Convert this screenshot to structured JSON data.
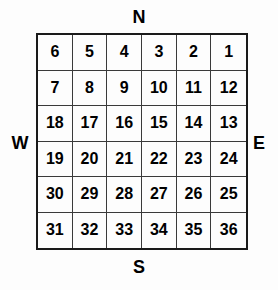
{
  "diagram": {
    "compass": {
      "north": "N",
      "south": "S",
      "west": "W",
      "east": "E"
    },
    "grid": {
      "rows": 6,
      "columns": 6,
      "cells": [
        "6",
        "5",
        "4",
        "3",
        "2",
        "1",
        "7",
        "8",
        "9",
        "10",
        "11",
        "12",
        "18",
        "17",
        "16",
        "15",
        "14",
        "13",
        "19",
        "20",
        "21",
        "22",
        "23",
        "24",
        "30",
        "29",
        "28",
        "27",
        "26",
        "25",
        "31",
        "32",
        "33",
        "34",
        "35",
        "36"
      ]
    },
    "colors": {
      "background": "#fdfdfd",
      "outer_border": "#1a1a1a",
      "inner_border": "#3a3a3a",
      "text": "#000000"
    }
  }
}
